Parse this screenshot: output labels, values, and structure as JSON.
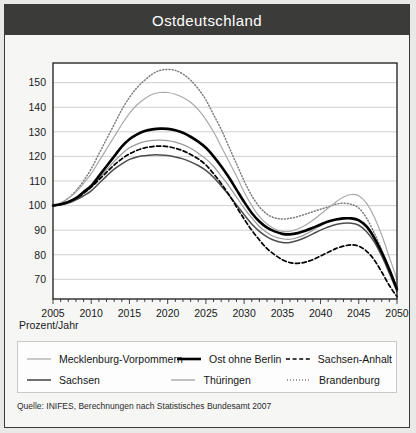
{
  "title": "Ostdeutschland",
  "axis_name": "Prozent/Jahr",
  "source": "Quelle: INIFES, Berechnungen nach Statistisches Bundesamt 2007",
  "colors": {
    "title_bar": "#3b3b39",
    "title_text": "#ffffff",
    "plot_bg": "#f6f6f5",
    "grid": "#c4c4c2",
    "axis": "#1a1a1a",
    "mecklenburg": "#a9a9a7",
    "sachsen": "#4d4d4b",
    "ost_ohne_berlin": "#000000",
    "thueringen": "#9a9a98",
    "sachsen_anhalt": "#000000",
    "brandenburg": "#7c7c7a"
  },
  "legend": {
    "rows": [
      [
        {
          "label": "Mecklenburg-Vorpommern",
          "style": "solid-thin-gray",
          "color": "#a9a9a7"
        },
        {
          "label": "Ost ohne Berlin",
          "style": "solid-thick-black",
          "color": "#000000"
        },
        {
          "label": "Sachsen-Anhalt",
          "style": "dashed-black",
          "color": "#000000"
        }
      ],
      [
        {
          "label": "Sachsen",
          "style": "solid-dark",
          "color": "#4d4d4b"
        },
        {
          "label": "Thüringen",
          "style": "solid-thin-gray2",
          "color": "#9a9a98"
        },
        {
          "label": "Brandenburg",
          "style": "dotted-gray",
          "color": "#7c7c7a"
        }
      ]
    ]
  },
  "chart_data": {
    "type": "line",
    "title": "Ostdeutschland",
    "xlabel": "",
    "ylabel": "Prozent/Jahr",
    "xlim": [
      2005,
      2050
    ],
    "ylim": [
      62,
      158
    ],
    "yticks": [
      70,
      80,
      90,
      100,
      110,
      120,
      130,
      140,
      150
    ],
    "xticks": [
      2005,
      2010,
      2015,
      2020,
      2025,
      2030,
      2035,
      2040,
      2045,
      2050
    ],
    "minor_xtick_interval": 1,
    "grid": "horizontal",
    "legend_position": "below",
    "x": [
      2005,
      2006,
      2007,
      2008,
      2009,
      2010,
      2011,
      2012,
      2013,
      2014,
      2015,
      2016,
      2017,
      2018,
      2019,
      2020,
      2021,
      2022,
      2023,
      2024,
      2025,
      2026,
      2027,
      2028,
      2029,
      2030,
      2031,
      2032,
      2033,
      2034,
      2035,
      2036,
      2037,
      2038,
      2039,
      2040,
      2041,
      2042,
      2043,
      2044,
      2045,
      2046,
      2047,
      2048,
      2049,
      2050
    ],
    "series": [
      {
        "name": "Brandenburg",
        "style": "dotted",
        "color": "#7c7c7a",
        "values": [
          100,
          101,
          103,
          106,
          110,
          115,
          121,
          127,
          133,
          139,
          144,
          148,
          151,
          153.5,
          155,
          155.4,
          155,
          153.5,
          151,
          147.5,
          143,
          137,
          131,
          124,
          117,
          110,
          104,
          99.5,
          96.5,
          95,
          94.5,
          94.8,
          95.5,
          96.5,
          97.5,
          98.5,
          99.5,
          100.5,
          101,
          100.5,
          99,
          95,
          89,
          82,
          74,
          67
        ]
      },
      {
        "name": "Mecklenburg-Vorpommern",
        "style": "solid-thin",
        "color": "#a9a9a7",
        "values": [
          100,
          101,
          103,
          105.5,
          109,
          113,
          118,
          123,
          128,
          133,
          137.5,
          141,
          143.5,
          145.3,
          146,
          146,
          145.3,
          144,
          142,
          139,
          135,
          130,
          124,
          118,
          112,
          105.5,
          100,
          95.5,
          92.5,
          90.5,
          89.5,
          89.5,
          90.5,
          92,
          94,
          96.5,
          99,
          101.5,
          103.5,
          104.5,
          104,
          101,
          95.5,
          88,
          79,
          70
        ]
      },
      {
        "name": "Ost ohne Berlin",
        "style": "solid-thick",
        "color": "#000000",
        "values": [
          100,
          100.5,
          101.5,
          103,
          105.5,
          108,
          112,
          116,
          120,
          124,
          127,
          129,
          130.3,
          131,
          131.3,
          131.2,
          130.6,
          129.6,
          128,
          126,
          123.5,
          120,
          116,
          111.5,
          106.5,
          101.5,
          97,
          93.5,
          91,
          89.5,
          88.5,
          88.3,
          88.8,
          89.8,
          91,
          92.3,
          93.5,
          94.3,
          94.8,
          94.8,
          94,
          91.5,
          87,
          81,
          74,
          66
        ]
      },
      {
        "name": "Thüringen",
        "style": "solid-thin",
        "color": "#9a9a98",
        "values": [
          100,
          100.5,
          101.5,
          103,
          105,
          107.5,
          111,
          114.5,
          118,
          121,
          123.5,
          125,
          126,
          126.5,
          126.6,
          126.4,
          125.8,
          124.8,
          123.3,
          121.3,
          119,
          116,
          112,
          108,
          103.5,
          99,
          95,
          91.5,
          89,
          87.3,
          86.5,
          86.3,
          87,
          88.3,
          90,
          91.8,
          93.3,
          94.3,
          95,
          95,
          94.3,
          92,
          87.5,
          81.5,
          74,
          66
        ]
      },
      {
        "name": "Sachsen-Anhalt",
        "style": "dashed",
        "color": "#000000",
        "values": [
          100,
          100.5,
          101.5,
          103,
          105,
          107.5,
          110.5,
          113.5,
          116.5,
          119,
          121,
          122.5,
          123.5,
          124,
          124.2,
          124,
          123.3,
          122.3,
          120.8,
          119,
          116.5,
          113,
          109,
          104.5,
          99.5,
          94.5,
          90,
          86,
          82.5,
          80,
          78,
          76.8,
          76.5,
          77,
          78,
          79.5,
          81,
          82.5,
          83.5,
          84,
          83.5,
          81.5,
          78,
          73,
          67.5,
          63
        ]
      },
      {
        "name": "Sachsen",
        "style": "solid-medium",
        "color": "#4d4d4b",
        "values": [
          100,
          100.3,
          101,
          102.3,
          104,
          106,
          109,
          112,
          114.8,
          117,
          118.8,
          119.8,
          120.3,
          120.6,
          120.6,
          120.4,
          119.8,
          119,
          117.8,
          116.3,
          114.3,
          111.5,
          108,
          104.3,
          100.3,
          96.3,
          92.5,
          89.5,
          87.3,
          85.8,
          85,
          85,
          85.8,
          87,
          88.5,
          90,
          91.3,
          92.3,
          92.8,
          92.8,
          92,
          89.5,
          85.3,
          79.5,
          72.5,
          65
        ]
      }
    ]
  }
}
